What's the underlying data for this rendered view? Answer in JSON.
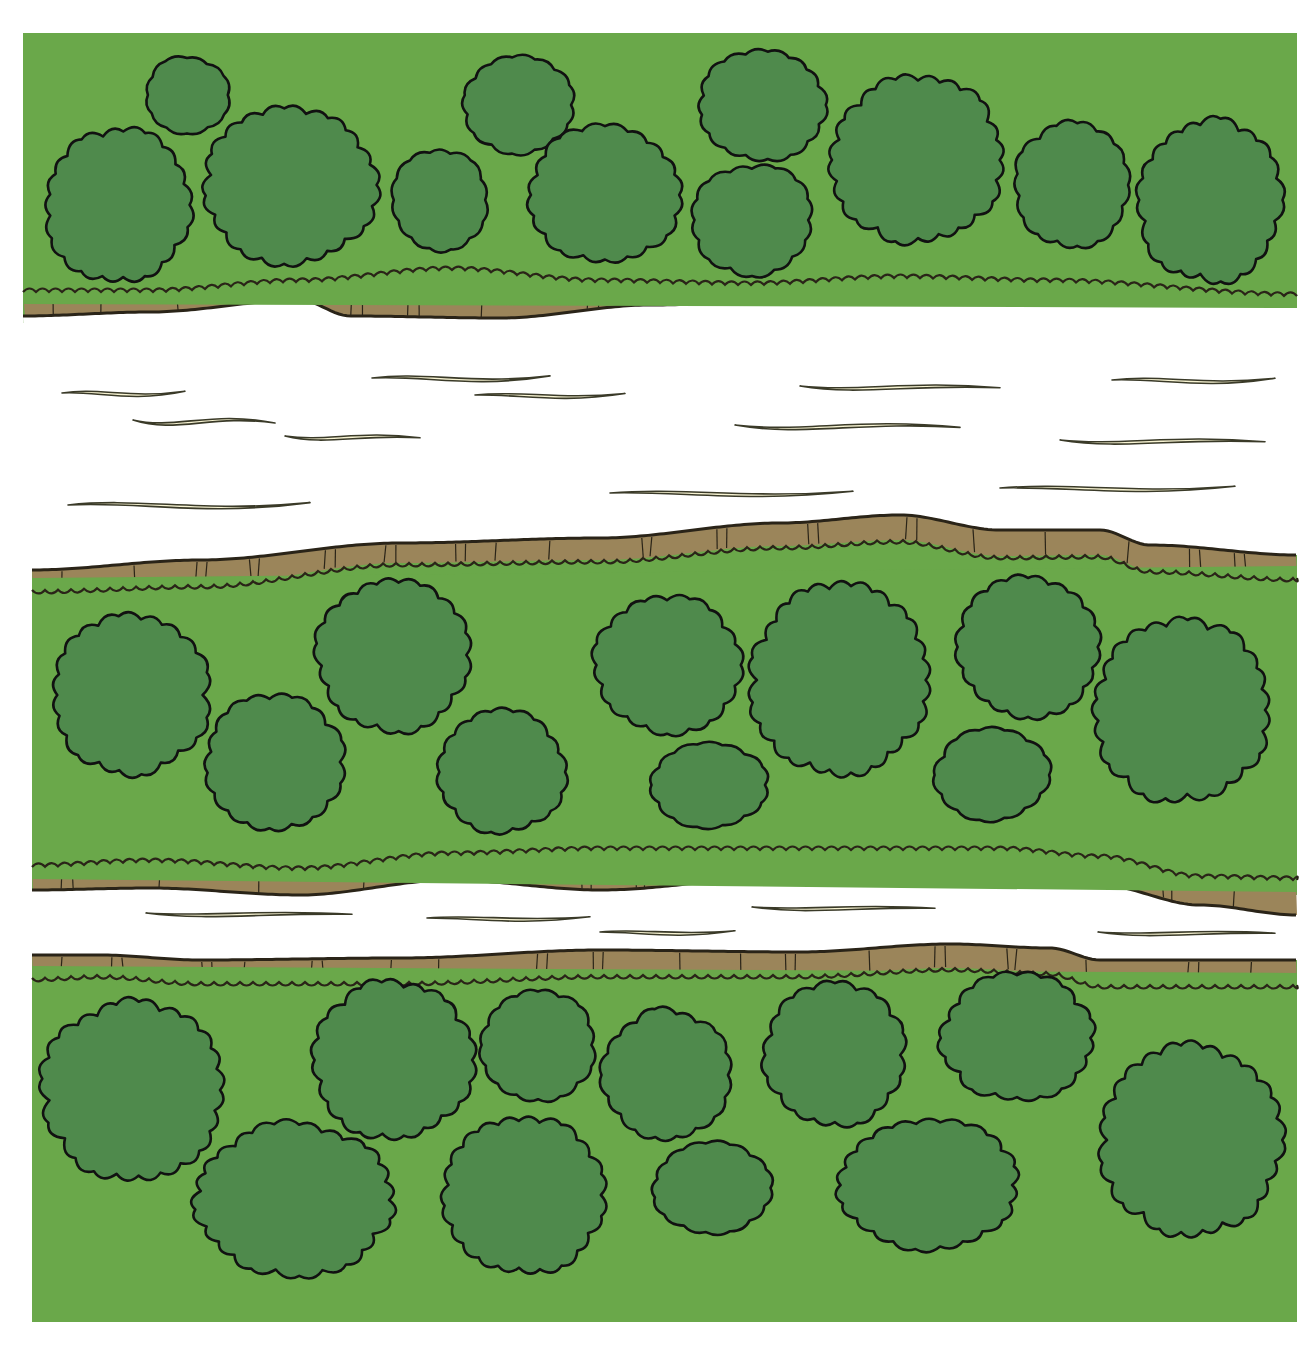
{
  "scene": {
    "title": "Top-down view of a river with two channels flowing between wooded banks",
    "colors": {
      "background": "#ffffff",
      "grass": "#6aa84a",
      "tree_fill": "#4f8a4c",
      "tree_outline": "#111111",
      "bank": "#9b855a",
      "bank_line": "#2a2418",
      "water": "#ffffff",
      "ripple_fill": "#f7f3d2",
      "ripple_outline": "#3a3a28"
    }
  },
  "regions": {
    "top_land": {
      "label": "North bank woodland",
      "x": 23,
      "y": 33,
      "w": 1274,
      "h": 290
    },
    "middle_island": {
      "label": "Central island woodland",
      "x": 32,
      "y": 515,
      "w": 1265,
      "h": 380
    },
    "bottom_land": {
      "label": "South bank woodland",
      "x": 32,
      "y": 940,
      "w": 1265,
      "h": 382
    }
  },
  "banks": [
    {
      "name": "north-bank",
      "top": [
        [
          23,
          292
        ],
        [
          150,
          292
        ],
        [
          300,
          282
        ],
        [
          450,
          270
        ],
        [
          600,
          282
        ],
        [
          750,
          285
        ],
        [
          900,
          278
        ],
        [
          1050,
          282
        ],
        [
          1297,
          296
        ]
      ],
      "bottom": [
        [
          23,
          316
        ],
        [
          150,
          312
        ],
        [
          300,
          300
        ],
        [
          350,
          316
        ],
        [
          500,
          318
        ],
        [
          650,
          305
        ],
        [
          800,
          300
        ],
        [
          900,
          294
        ],
        [
          1050,
          302
        ],
        [
          1200,
          302
        ],
        [
          1297,
          306
        ]
      ]
    },
    {
      "name": "island-north-bank",
      "top": [
        [
          32,
          570
        ],
        [
          200,
          560
        ],
        [
          400,
          543
        ],
        [
          600,
          538
        ],
        [
          780,
          523
        ],
        [
          900,
          515
        ],
        [
          1000,
          530
        ],
        [
          1100,
          530
        ],
        [
          1150,
          545
        ],
        [
          1297,
          555
        ]
      ],
      "bottom": [
        [
          32,
          590
        ],
        [
          200,
          585
        ],
        [
          400,
          563
        ],
        [
          600,
          560
        ],
        [
          780,
          546
        ],
        [
          900,
          540
        ],
        [
          1000,
          556
        ],
        [
          1100,
          555
        ],
        [
          1150,
          570
        ],
        [
          1297,
          578
        ]
      ]
    },
    {
      "name": "island-south-bank",
      "top": [
        [
          32,
          867
        ],
        [
          150,
          862
        ],
        [
          300,
          870
        ],
        [
          450,
          855
        ],
        [
          600,
          850
        ],
        [
          800,
          850
        ],
        [
          1000,
          850
        ],
        [
          1100,
          858
        ],
        [
          1200,
          878
        ],
        [
          1297,
          880
        ]
      ],
      "bottom": [
        [
          32,
          890
        ],
        [
          150,
          888
        ],
        [
          300,
          895
        ],
        [
          450,
          880
        ],
        [
          600,
          890
        ],
        [
          800,
          875
        ],
        [
          1000,
          875
        ],
        [
          1100,
          885
        ],
        [
          1200,
          905
        ],
        [
          1297,
          915
        ]
      ]
    },
    {
      "name": "south-bank",
      "top": [
        [
          32,
          955
        ],
        [
          100,
          955
        ],
        [
          200,
          960
        ],
        [
          400,
          958
        ],
        [
          600,
          950
        ],
        [
          800,
          952
        ],
        [
          950,
          944
        ],
        [
          1050,
          948
        ],
        [
          1100,
          960
        ],
        [
          1297,
          960
        ]
      ],
      "bottom": [
        [
          32,
          978
        ],
        [
          100,
          975
        ],
        [
          200,
          982
        ],
        [
          400,
          982
        ],
        [
          600,
          975
        ],
        [
          800,
          975
        ],
        [
          950,
          968
        ],
        [
          1050,
          972
        ],
        [
          1100,
          985
        ],
        [
          1297,
          985
        ]
      ]
    }
  ],
  "trees": [
    {
      "cx": 187,
      "cy": 95,
      "rx": 42,
      "ry": 38
    },
    {
      "cx": 118,
      "cy": 205,
      "rx": 72,
      "ry": 75
    },
    {
      "cx": 290,
      "cy": 185,
      "rx": 85,
      "ry": 78
    },
    {
      "cx": 440,
      "cy": 200,
      "rx": 48,
      "ry": 50
    },
    {
      "cx": 518,
      "cy": 105,
      "rx": 55,
      "ry": 48
    },
    {
      "cx": 605,
      "cy": 195,
      "rx": 75,
      "ry": 68
    },
    {
      "cx": 762,
      "cy": 105,
      "rx": 63,
      "ry": 55
    },
    {
      "cx": 752,
      "cy": 220,
      "rx": 60,
      "ry": 55
    },
    {
      "cx": 918,
      "cy": 160,
      "rx": 85,
      "ry": 82
    },
    {
      "cx": 1072,
      "cy": 185,
      "rx": 57,
      "ry": 62
    },
    {
      "cx": 1210,
      "cy": 200,
      "rx": 72,
      "ry": 80
    },
    {
      "cx": 130,
      "cy": 695,
      "rx": 78,
      "ry": 78
    },
    {
      "cx": 275,
      "cy": 762,
      "rx": 68,
      "ry": 65
    },
    {
      "cx": 393,
      "cy": 655,
      "rx": 75,
      "ry": 75
    },
    {
      "cx": 502,
      "cy": 772,
      "rx": 63,
      "ry": 60
    },
    {
      "cx": 667,
      "cy": 665,
      "rx": 72,
      "ry": 68
    },
    {
      "cx": 710,
      "cy": 785,
      "rx": 58,
      "ry": 42
    },
    {
      "cx": 840,
      "cy": 680,
      "rx": 88,
      "ry": 92
    },
    {
      "cx": 1028,
      "cy": 647,
      "rx": 70,
      "ry": 70
    },
    {
      "cx": 992,
      "cy": 775,
      "rx": 56,
      "ry": 45
    },
    {
      "cx": 1182,
      "cy": 710,
      "rx": 88,
      "ry": 90
    },
    {
      "cx": 133,
      "cy": 1090,
      "rx": 90,
      "ry": 88
    },
    {
      "cx": 293,
      "cy": 1200,
      "rx": 97,
      "ry": 75
    },
    {
      "cx": 393,
      "cy": 1060,
      "rx": 78,
      "ry": 78
    },
    {
      "cx": 538,
      "cy": 1045,
      "rx": 57,
      "ry": 55
    },
    {
      "cx": 524,
      "cy": 1195,
      "rx": 80,
      "ry": 78
    },
    {
      "cx": 666,
      "cy": 1075,
      "rx": 63,
      "ry": 65
    },
    {
      "cx": 712,
      "cy": 1188,
      "rx": 58,
      "ry": 45
    },
    {
      "cx": 835,
      "cy": 1055,
      "rx": 70,
      "ry": 70
    },
    {
      "cx": 928,
      "cy": 1185,
      "rx": 88,
      "ry": 65
    },
    {
      "cx": 1017,
      "cy": 1038,
      "rx": 75,
      "ry": 62
    },
    {
      "cx": 1192,
      "cy": 1140,
      "rx": 90,
      "ry": 93
    }
  ],
  "ripples": [
    {
      "x1": 62,
      "y": 393,
      "x2": 185,
      "amp": 6
    },
    {
      "x1": 133,
      "y": 420,
      "x2": 275,
      "amp": -10
    },
    {
      "x1": 372,
      "y": 378,
      "x2": 550,
      "amp": 7
    },
    {
      "x1": 475,
      "y": 395,
      "x2": 625,
      "amp": 5
    },
    {
      "x1": 285,
      "y": 436,
      "x2": 420,
      "amp": -6
    },
    {
      "x1": 68,
      "y": 505,
      "x2": 310,
      "amp": 8
    },
    {
      "x1": 800,
      "y": 386,
      "x2": 1000,
      "amp": -6
    },
    {
      "x1": 735,
      "y": 425,
      "x2": 960,
      "amp": -8
    },
    {
      "x1": 1112,
      "y": 380,
      "x2": 1275,
      "amp": 6
    },
    {
      "x1": 1060,
      "y": 440,
      "x2": 1265,
      "amp": -6
    },
    {
      "x1": 610,
      "y": 493,
      "x2": 853,
      "amp": 6
    },
    {
      "x1": 1000,
      "y": 488,
      "x2": 1235,
      "amp": 6
    },
    {
      "x1": 146,
      "y": 913,
      "x2": 352,
      "amp": -4
    },
    {
      "x1": 427,
      "y": 918,
      "x2": 590,
      "amp": 4
    },
    {
      "x1": 600,
      "y": 932,
      "x2": 735,
      "amp": 4
    },
    {
      "x1": 752,
      "y": 907,
      "x2": 935,
      "amp": -4
    },
    {
      "x1": 1098,
      "y": 932,
      "x2": 1275,
      "amp": -4
    }
  ]
}
